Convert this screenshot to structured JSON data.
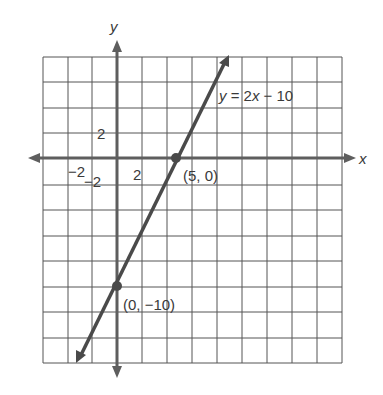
{
  "diagram": {
    "axes": {
      "x_label": "x",
      "y_label": "y",
      "x_tick_label": "2",
      "x_neg_tick_label": "−2",
      "y_tick_label": "2",
      "y_neg_tick_label": "−2",
      "units_per_cell": 2
    },
    "line": {
      "equation_label": "y = 2x − 10",
      "equation_y": "y",
      "equation_rest_1": " = 2",
      "equation_x": "x",
      "equation_rest_2": " − 10",
      "slope": 2,
      "intercept": -10
    },
    "points": [
      {
        "label": "(5, 0)",
        "x": 5,
        "y": 0
      },
      {
        "label": "(0, −10)",
        "x": 0,
        "y": -10
      }
    ],
    "colors": {
      "grid": "#555555",
      "axis": "#5e5e5e",
      "line": "#4a4a4a",
      "text": "#3a3a3a"
    }
  }
}
